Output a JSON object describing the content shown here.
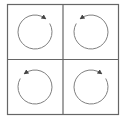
{
  "diagram": {
    "stroke_color": "#555555",
    "background": "#ffffff",
    "cells": [
      {
        "position": "top-left",
        "rotation": "clockwise",
        "icon": "rotate-cw-icon"
      },
      {
        "position": "top-right",
        "rotation": "counterclockwise",
        "icon": "rotate-ccw-icon"
      },
      {
        "position": "bottom-left",
        "rotation": "counterclockwise",
        "icon": "rotate-ccw-icon"
      },
      {
        "position": "bottom-right",
        "rotation": "clockwise",
        "icon": "rotate-cw-icon"
      }
    ]
  }
}
